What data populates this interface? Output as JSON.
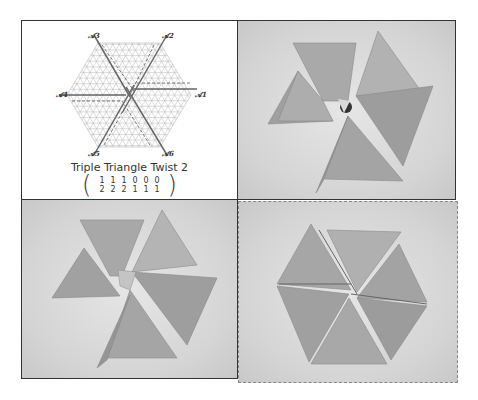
{
  "diagram": {
    "title": "Triple Triangle Twist 2",
    "axis_labels": {
      "a1": "𝒜1",
      "a2": "𝒜2",
      "a3": "𝒜3",
      "a4": "𝒜4",
      "a5": "𝒜5",
      "a6": "𝒜6"
    },
    "formula": {
      "numerators": [
        "1",
        "1",
        "1",
        "0",
        "0",
        "0"
      ],
      "denominators": [
        "2",
        "2",
        "2",
        "1",
        "1",
        "1"
      ],
      "separator": "'"
    }
  },
  "photos": [
    {
      "name": "folded-model-photo-1",
      "description": "Triple triangle twist origami, front view with tight central twist"
    },
    {
      "name": "folded-model-photo-2",
      "description": "Triple triangle twist origami, partially opened central twist"
    },
    {
      "name": "folded-model-photo-3",
      "description": "Triple triangle twist origami, flat-folded hexagon"
    }
  ],
  "colors": {
    "border": "#333333",
    "dashed_border": "#888888",
    "paper": "#a8a8a8",
    "grid": "#b0b0b0",
    "fold_line": "#666666"
  }
}
